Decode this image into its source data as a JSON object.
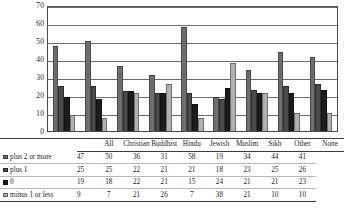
{
  "chart_data": {
    "type": "bar",
    "title": "",
    "xlabel": "",
    "ylabel": "",
    "ylim": [
      0,
      70
    ],
    "yticks": [
      70,
      60,
      50,
      40,
      30,
      20,
      10,
      0
    ],
    "grid": true,
    "legend_position": "table-row-labels",
    "categories": [
      "All",
      "Christian",
      "Buddhist",
      "Hindu",
      "Jewish",
      "Muslim",
      "Sikh",
      "Other",
      "None"
    ],
    "series": [
      {
        "name": "plus 2 or more",
        "color": "#6e6e6e",
        "values": [
          47,
          50,
          36,
          31,
          58,
          19,
          34,
          44,
          41
        ]
      },
      {
        "name": "plus 1",
        "color": "#4a4a4a",
        "values": [
          25,
          25,
          22,
          21,
          21,
          18,
          23,
          25,
          26
        ]
      },
      {
        "name": "0",
        "color": "#1c1c1c",
        "values": [
          19,
          18,
          22,
          21,
          15,
          24,
          21,
          21,
          23
        ]
      },
      {
        "name": "minus 1 or less",
        "color": "#b0b0b0",
        "values": [
          9,
          7,
          21,
          26,
          7,
          38,
          21,
          10,
          10
        ]
      }
    ]
  },
  "table": {
    "row_label_header": "",
    "column_headers": [
      "All",
      "Christian",
      "Buddhist",
      "Hindu",
      "Jewish",
      "Muslim",
      "Sikh",
      "Other",
      "None"
    ],
    "rows": [
      {
        "label": "plus 2 or more",
        "swatch": "#6e6e6e",
        "values": [
          "47",
          "50",
          "36",
          "31",
          "58",
          "19",
          "34",
          "44",
          "41"
        ]
      },
      {
        "label": "plus 1",
        "swatch": "#4a4a4a",
        "values": [
          "25",
          "25",
          "22",
          "21",
          "21",
          "18",
          "23",
          "25",
          "26"
        ]
      },
      {
        "label": "0",
        "swatch": "#1c1c1c",
        "values": [
          "19",
          "18",
          "22",
          "21",
          "15",
          "24",
          "21",
          "21",
          "23"
        ]
      },
      {
        "label": "minus 1 or less",
        "swatch": "#b0b0b0",
        "values": [
          "9",
          "7",
          "21",
          "26",
          "7",
          "38",
          "21",
          "10",
          "10"
        ]
      }
    ]
  }
}
